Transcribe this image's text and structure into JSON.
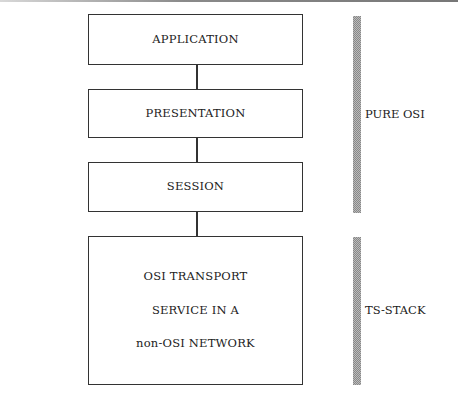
{
  "diagram": {
    "layers": [
      {
        "id": "application",
        "lines": [
          "APPLICATION"
        ]
      },
      {
        "id": "presentation",
        "lines": [
          "PRESENTATION"
        ]
      },
      {
        "id": "session",
        "lines": [
          "SESSION"
        ]
      },
      {
        "id": "transport",
        "lines": [
          "OSI TRANSPORT",
          "SERVICE IN A",
          "non-OSI NETWORK"
        ]
      }
    ],
    "brackets": [
      {
        "id": "pure-osi",
        "label": "PURE OSI",
        "spans": [
          "application",
          "presentation",
          "session"
        ]
      },
      {
        "id": "ts-stack",
        "label": "TS-STACK",
        "spans": [
          "transport"
        ]
      }
    ]
  }
}
